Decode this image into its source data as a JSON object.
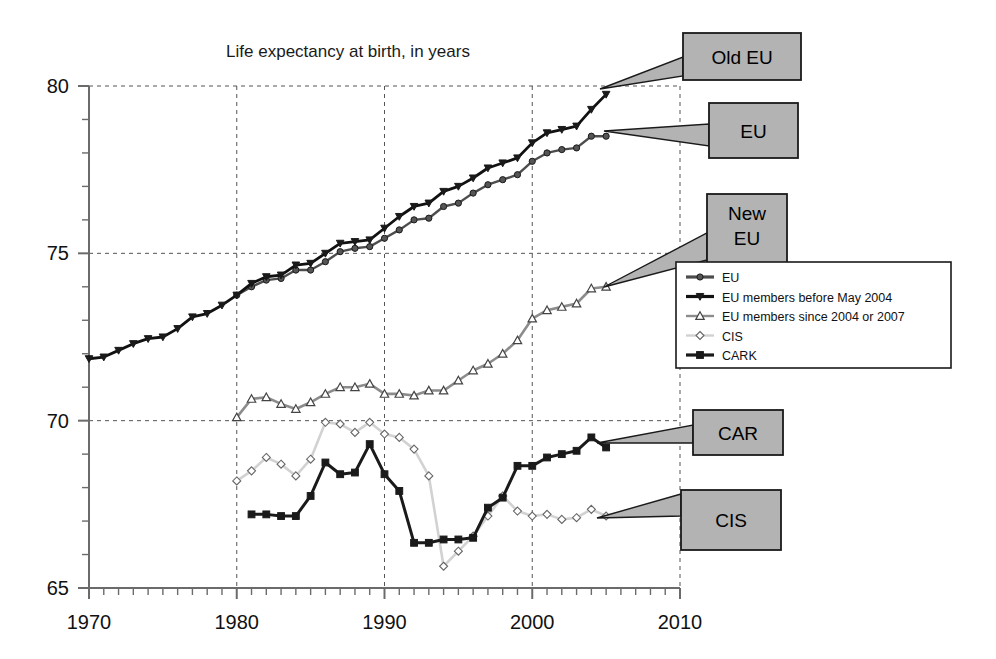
{
  "chart_data": {
    "type": "line",
    "title": "Life expectancy at birth, in years",
    "xlabel": "",
    "ylabel": "",
    "xlim": [
      1970,
      2010
    ],
    "ylim": [
      65,
      80
    ],
    "x_ticks": [
      1970,
      1980,
      1990,
      2000,
      2010
    ],
    "y_ticks": [
      65,
      70,
      75,
      80
    ],
    "x_minor_step": 1,
    "y_minor_step": 1,
    "grid": "dashed gridlines at major x and y ticks",
    "legend_position": "right-middle",
    "series": [
      {
        "name": "EU",
        "legend_label": "EU",
        "marker": "circle",
        "color": "#4d4d4d",
        "x": [
          1980,
          1981,
          1982,
          1983,
          1984,
          1985,
          1986,
          1987,
          1988,
          1989,
          1990,
          1991,
          1992,
          1993,
          1994,
          1995,
          1996,
          1997,
          1998,
          1999,
          2000,
          2001,
          2002,
          2003,
          2004,
          2005
        ],
        "values": [
          73.75,
          74.0,
          74.2,
          74.25,
          74.5,
          74.5,
          74.75,
          75.05,
          75.15,
          75.2,
          75.45,
          75.7,
          76.0,
          76.05,
          76.4,
          76.5,
          76.8,
          77.05,
          77.2,
          77.35,
          77.75,
          78.0,
          78.1,
          78.15,
          78.5,
          78.5
        ]
      },
      {
        "name": "EU members before May 2004",
        "legend_label": "EU members before May 2004",
        "marker": "triangle-down",
        "color": "#111111",
        "x": [
          1970,
          1971,
          1972,
          1973,
          1974,
          1975,
          1976,
          1977,
          1978,
          1979,
          1980,
          1981,
          1982,
          1983,
          1984,
          1985,
          1986,
          1987,
          1988,
          1989,
          1990,
          1991,
          1992,
          1993,
          1994,
          1995,
          1996,
          1997,
          1998,
          1999,
          2000,
          2001,
          2002,
          2003,
          2004,
          2005
        ],
        "values": [
          71.85,
          71.9,
          72.1,
          72.3,
          72.45,
          72.5,
          72.75,
          73.1,
          73.2,
          73.45,
          73.75,
          74.1,
          74.3,
          74.35,
          74.65,
          74.7,
          75.0,
          75.3,
          75.35,
          75.4,
          75.75,
          76.1,
          76.4,
          76.5,
          76.85,
          77.0,
          77.25,
          77.55,
          77.7,
          77.85,
          78.3,
          78.6,
          78.7,
          78.8,
          79.3,
          79.75
        ]
      },
      {
        "name": "EU members since 2004 or 2007",
        "legend_label": "EU members since 2004 or 2007",
        "marker": "triangle-up",
        "color": "#8c8c8c",
        "x": [
          1980,
          1981,
          1982,
          1983,
          1984,
          1985,
          1986,
          1987,
          1988,
          1989,
          1990,
          1991,
          1992,
          1993,
          1994,
          1995,
          1996,
          1997,
          1998,
          1999,
          2000,
          2001,
          2002,
          2003,
          2004,
          2005
        ],
        "values": [
          70.1,
          70.65,
          70.7,
          70.5,
          70.35,
          70.55,
          70.8,
          71.0,
          71.0,
          71.1,
          70.8,
          70.8,
          70.75,
          70.9,
          70.9,
          71.2,
          71.5,
          71.7,
          72.0,
          72.4,
          73.05,
          73.3,
          73.4,
          73.5,
          73.95,
          74.0
        ]
      },
      {
        "name": "CIS",
        "legend_label": "CIS",
        "marker": "diamond",
        "color": "#d2d2d2",
        "x": [
          1980,
          1981,
          1982,
          1983,
          1984,
          1985,
          1986,
          1987,
          1988,
          1989,
          1990,
          1991,
          1992,
          1993,
          1994,
          1995,
          1996,
          1997,
          1998,
          1999,
          2000,
          2001,
          2002,
          2003,
          2004,
          2005
        ],
        "values": [
          68.2,
          68.5,
          68.9,
          68.7,
          68.35,
          68.85,
          69.95,
          69.9,
          69.65,
          69.95,
          69.6,
          69.5,
          69.15,
          68.35,
          65.65,
          66.1,
          66.55,
          67.15,
          67.75,
          67.3,
          67.15,
          67.2,
          67.05,
          67.1,
          67.35,
          67.15
        ]
      },
      {
        "name": "CARK",
        "legend_label": "CARK",
        "marker": "square",
        "color": "#1a1a1a",
        "x": [
          1981,
          1982,
          1983,
          1984,
          1985,
          1986,
          1987,
          1988,
          1989,
          1990,
          1991,
          1992,
          1993,
          1994,
          1995,
          1996,
          1997,
          1998,
          1999,
          2000,
          2001,
          2002,
          2003,
          2004,
          2005
        ],
        "values": [
          67.2,
          67.2,
          67.15,
          67.15,
          67.75,
          68.75,
          68.4,
          68.45,
          69.3,
          68.4,
          67.9,
          66.35,
          66.35,
          66.45,
          66.45,
          66.5,
          67.4,
          67.7,
          68.65,
          68.65,
          68.9,
          69.0,
          69.1,
          69.5,
          69.2
        ]
      }
    ]
  },
  "callouts": [
    {
      "name": "old-eu",
      "label": "Old EU",
      "lines": [
        "Old EU"
      ]
    },
    {
      "name": "eu",
      "label": "EU",
      "lines": [
        "EU"
      ]
    },
    {
      "name": "new-eu",
      "label": "New EU",
      "lines": [
        "New",
        "EU"
      ]
    },
    {
      "name": "car",
      "label": "CAR",
      "lines": [
        "CAR"
      ]
    },
    {
      "name": "cis",
      "label": "CIS",
      "lines": [
        "CIS"
      ]
    }
  ],
  "legend": {
    "items": [
      {
        "label": "EU",
        "marker": "circle",
        "color": "#4d4d4d"
      },
      {
        "label": "EU members before May 2004",
        "marker": "triangle-down",
        "color": "#111111"
      },
      {
        "label": "EU members since 2004 or 2007",
        "marker": "triangle-up",
        "color": "#8c8c8c"
      },
      {
        "label": "CIS",
        "marker": "diamond",
        "color": "#d2d2d2"
      },
      {
        "label": "CARK",
        "marker": "square",
        "color": "#1a1a1a"
      }
    ]
  },
  "colors": {
    "axis": "#6b6b6b",
    "grid": "#555555",
    "callout_fill": "#b3b3b3",
    "callout_stroke": "#1a1a1a",
    "background": "#ffffff"
  }
}
